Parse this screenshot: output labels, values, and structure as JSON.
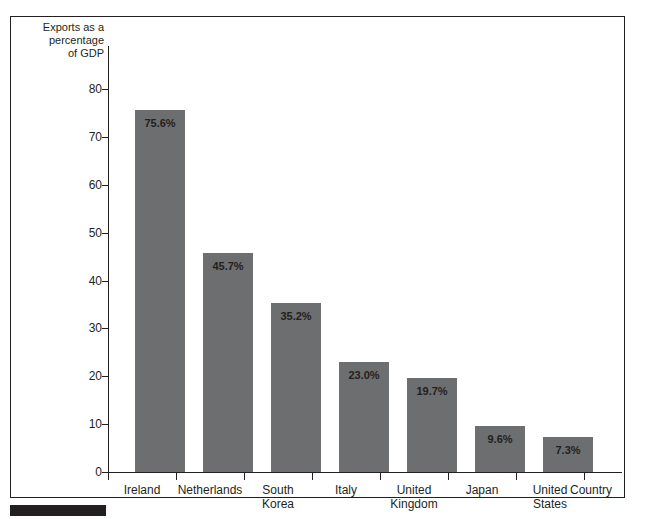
{
  "chart_data": {
    "type": "bar",
    "title": "",
    "xlabel": "Country",
    "ylabel": "Exports as a percentage of GDP",
    "ylim": [
      0,
      80
    ],
    "yticks": [
      0,
      10,
      20,
      30,
      40,
      50,
      60,
      70,
      80
    ],
    "ytick_labels": [
      "0",
      "10",
      "20",
      "30",
      "40",
      "50",
      "60",
      "70",
      "80"
    ],
    "grid": false,
    "legend": false,
    "bar_color": "#6d6e70",
    "categories": [
      "Ireland",
      "Netherlands",
      "South Korea",
      "Italy",
      "United Kingdom",
      "Japan",
      "United States"
    ],
    "category_lines": [
      [
        "Ireland"
      ],
      [
        "Netherlands"
      ],
      [
        "South",
        "Korea"
      ],
      [
        "Italy"
      ],
      [
        "United",
        "Kingdom"
      ],
      [
        "Japan"
      ],
      [
        "United",
        "States"
      ]
    ],
    "values": [
      75.6,
      45.7,
      35.2,
      23.0,
      19.7,
      9.6,
      7.3
    ],
    "value_labels": [
      "75.6%",
      "45.7%",
      "35.2%",
      "23.0%",
      "19.7%",
      "9.6%",
      "7.3%"
    ]
  },
  "axes": {
    "y_title_lines": [
      "Exports as a",
      "percentage",
      "of GDP"
    ],
    "y_title": "Exports as a percentage of GDP",
    "x_title": "Country"
  }
}
